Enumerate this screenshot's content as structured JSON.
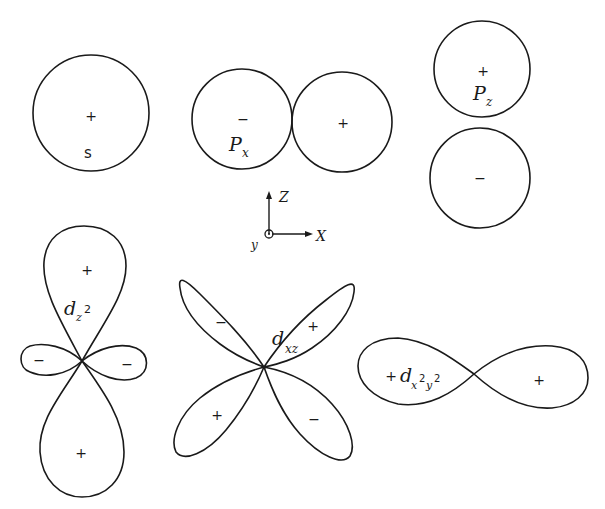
{
  "figure": {
    "orbitals": [
      {
        "id": "s",
        "label": "s",
        "signs": [
          "+"
        ]
      },
      {
        "id": "px",
        "label_main": "P",
        "label_sub": "x",
        "signs": [
          "−",
          "+"
        ]
      },
      {
        "id": "pz",
        "label_main": "P",
        "label_sub": "z",
        "signs": [
          "+",
          "−"
        ]
      },
      {
        "id": "dz2",
        "label_main": "d",
        "label_sub": "z",
        "label_sup": "2",
        "signs": [
          "+",
          "−",
          "−",
          "+"
        ]
      },
      {
        "id": "dxz",
        "label_main": "d",
        "label_sub": "xz",
        "signs": [
          "−",
          "+",
          "+",
          "−"
        ]
      },
      {
        "id": "dx2y2",
        "label_main": "d",
        "label_sub1": "x",
        "label_sup1": "2",
        "label_sub2": "y",
        "label_sup2": "2",
        "signs": [
          "+",
          "+"
        ]
      }
    ],
    "axes": {
      "z": "Z",
      "x": "X",
      "y": "y"
    }
  }
}
